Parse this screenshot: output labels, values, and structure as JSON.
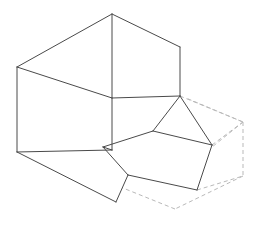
{
  "figure": {
    "type": "isometric-line-drawing",
    "background_color": "#ffffff",
    "solid_line_color": "#4a4a4a",
    "hidden_line_color": "#b9b9b9",
    "solid_line_width": 1,
    "hidden_line_width": 1,
    "hidden_line_dash": "4 3",
    "canvas": {
      "width": 254,
      "height": 229
    }
  },
  "geometry": {
    "vertices": {
      "top_apex": [
        112,
        14
      ],
      "top_right": [
        180,
        47
      ],
      "top_left": [
        17,
        67
      ],
      "mid_center": [
        112,
        98
      ],
      "step_front_right": [
        180,
        96
      ],
      "left_bottom": [
        17,
        152
      ],
      "bottom_center": [
        116,
        202
      ],
      "step_low_left": [
        103,
        147
      ],
      "notch_mid": [
        153,
        131
      ],
      "notch_right": [
        212,
        145
      ],
      "notch_bottom": [
        197,
        190
      ],
      "notch_low_left": [
        128,
        175
      ],
      "hidden_right": [
        243,
        122
      ],
      "hidden_far_top": [
        186,
        98
      ],
      "hidden_bottom_right": [
        243,
        176
      ],
      "hidden_bottom_mid": [
        175,
        209
      ],
      "hidden_left": [
        113,
        152
      ],
      "hidden_low_left": [
        113,
        184
      ]
    },
    "solid_paths": [
      "M112,14 L180,47",
      "M112,14 L17,67",
      "M112,14 L112,98",
      "M17,67 L17,152",
      "M17,67 L112,98",
      "M180,47 L180,96",
      "M112,98 L180,96",
      "M112,98 L112,150",
      "M17,152 L116,202",
      "M112,150 L103,147",
      "M180,96 L153,131",
      "M180,96 L212,145",
      "M153,131 L212,145",
      "M153,131 L103,147",
      "M103,147 L128,175",
      "M128,175 L197,190",
      "M197,190 L212,145",
      "M116,202 L128,175",
      "M112,150 L17,152"
    ],
    "hidden_paths": [
      "M180,96 L243,122",
      "M243,122 L243,176",
      "M243,122 L186,98",
      "M212,145 L243,122",
      "M197,190 L243,176",
      "M243,176 L175,209",
      "M175,209 L113,184",
      "M113,184 L113,152",
      "M113,152 L175,177",
      "M175,177 L243,122",
      "M128,175 L113,184",
      "M113,152 L180,96"
    ]
  }
}
